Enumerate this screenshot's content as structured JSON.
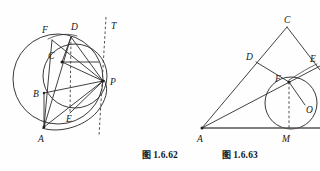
{
  "page": {
    "width": 320,
    "height": 171,
    "background_color": "#fefefe",
    "ink_color": "#2b2b2b",
    "content_type": "geometry-figure-pair"
  },
  "figures": [
    {
      "id": "figure-1-6-62",
      "caption_cjk": "图",
      "caption_number": "1.6.62",
      "caption_full": "图 1.6.62",
      "description": "Two internally tangent circles meeting at P with tangent line T; chords through points A, B, C, D, E, F",
      "point_labels": [
        {
          "name": "F",
          "text": "F",
          "x": 45,
          "y": 30
        },
        {
          "name": "D",
          "text": "D",
          "x": 74,
          "y": 27
        },
        {
          "name": "T",
          "text": "T",
          "x": 113,
          "y": 26
        },
        {
          "name": "C",
          "text": "C",
          "x": 51,
          "y": 55
        },
        {
          "name": "P",
          "text": "P",
          "x": 117,
          "y": 82
        },
        {
          "name": "B",
          "text": "B",
          "x": 36,
          "y": 98
        },
        {
          "name": "E",
          "text": "E",
          "x": 70,
          "y": 119
        },
        {
          "name": "A",
          "text": "A",
          "x": 41,
          "y": 139
        }
      ],
      "circles": [
        {
          "name": "large-circle",
          "cx": 58,
          "cy": 79,
          "r": 45
        },
        {
          "name": "small-circle",
          "cx": 75,
          "cy": 76,
          "r": 32
        },
        {
          "name": "arc-circle",
          "cx": 74,
          "cy": 88,
          "r": 31
        }
      ],
      "tangent_line": {
        "name": "tangent-line-T",
        "x1": 105,
        "y1": 17,
        "x2": 99,
        "y2": 135,
        "style": "dashed"
      },
      "dashed_chord": {
        "name": "dashed-chord-DE",
        "x1": 71,
        "y1": 36,
        "x2": 70,
        "y2": 112,
        "style": "dashed"
      }
    },
    {
      "id": "figure-1-6-63",
      "caption_cjk": "图",
      "caption_number": "1.6.63",
      "caption_full": "图 1.6.63",
      "description": "Triangle with inscribed circle centre O touching base at M, with points D, E, F and cevians from A",
      "point_labels": [
        {
          "name": "C",
          "text": "C",
          "x": 287,
          "y": 22
        },
        {
          "name": "D",
          "text": "D",
          "x": 249,
          "y": 57
        },
        {
          "name": "E",
          "text": "E",
          "x": 312,
          "y": 59
        },
        {
          "name": "F",
          "text": "F",
          "x": 275,
          "y": 80
        },
        {
          "name": "O",
          "text": "O",
          "x": 308,
          "y": 110
        },
        {
          "name": "A",
          "text": "A",
          "x": 199,
          "y": 139
        },
        {
          "name": "M",
          "text": "M",
          "x": 283,
          "y": 139
        }
      ],
      "circle": {
        "name": "inscribed-circle",
        "cx": 291,
        "cy": 103,
        "r": 26
      },
      "baseline": {
        "name": "baseline-AM",
        "x1": 202,
        "y1": 128,
        "x2": 320,
        "y2": 128
      },
      "dashed_segment": {
        "name": "dashed-segment-FM",
        "x1": 289,
        "y1": 82,
        "x2": 289,
        "y2": 128,
        "style": "dashed"
      }
    }
  ]
}
